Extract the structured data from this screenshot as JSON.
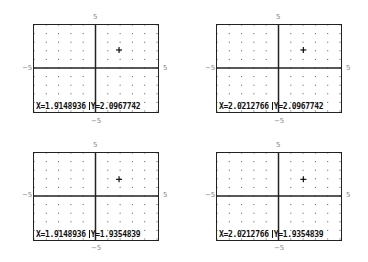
{
  "window": {
    "xmin": -5,
    "xmax": 5,
    "ymin": -5,
    "ymax": 5
  },
  "axis_labels": {
    "top": "5",
    "bottom": "−5",
    "left": "−5",
    "right": "5"
  },
  "panels": [
    {
      "x_label": "X=1.9148936",
      "y_label": "Y=2.0967742",
      "cursor_x": 1.9148936,
      "cursor_y": 2.0967742
    },
    {
      "x_label": "X=2.0212766",
      "y_label": "Y=2.0967742",
      "cursor_x": 2.0212766,
      "cursor_y": 2.0967742
    },
    {
      "x_label": "X=1.9148936",
      "y_label": "Y=1.9354839",
      "cursor_x": 1.9148936,
      "cursor_y": 1.9354839
    },
    {
      "x_label": "X=2.0212766",
      "y_label": "Y=1.9354839",
      "cursor_x": 2.0212766,
      "cursor_y": 1.9354839
    }
  ],
  "colors": {
    "axis": "#222222",
    "dot": "#555555",
    "label": "#888888"
  }
}
